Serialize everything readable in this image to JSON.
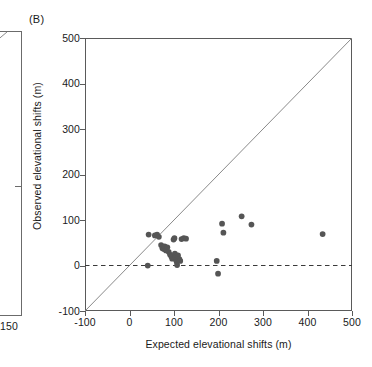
{
  "figure": {
    "panel_label": "(B)",
    "background_color": "#ffffff"
  },
  "left_partial_panel": {
    "visible_tick_label": "150",
    "axis_color": "#6b6b6b",
    "note_visible": "right edge of adjacent panel"
  },
  "chart_data": {
    "type": "scatter",
    "title": "(B)",
    "xlabel": "Expected elevational shifts (m)",
    "ylabel": "Observed elevational shifts (m)",
    "xlim": [
      -100,
      500
    ],
    "ylim": [
      -100,
      500
    ],
    "xticks": [
      -100,
      0,
      100,
      200,
      300,
      400,
      500
    ],
    "xtick_labels": [
      "-100",
      "0",
      "100",
      "200",
      "300",
      "400",
      "500"
    ],
    "yticks": [
      -100,
      0,
      100,
      200,
      300,
      400,
      500
    ],
    "ytick_labels": [
      "-100",
      "0",
      "100",
      "200",
      "300",
      "400",
      "500"
    ],
    "grid": false,
    "legend": null,
    "point_color": "#555555",
    "point_size": 4.6,
    "reference_lines": [
      {
        "name": "one-to-one-line",
        "style": "solid",
        "color": "#8a8a8a",
        "from": [
          -100,
          -100
        ],
        "to": [
          500,
          500
        ]
      },
      {
        "name": "zero-observed-shift-line",
        "style": "dashed",
        "color": "#3a3a3a",
        "y": 0
      }
    ],
    "points": [
      {
        "x": 43,
        "y": 68
      },
      {
        "x": 41,
        "y": 0
      },
      {
        "x": 57,
        "y": 66
      },
      {
        "x": 62,
        "y": 68
      },
      {
        "x": 66,
        "y": 63
      },
      {
        "x": 71,
        "y": 45
      },
      {
        "x": 74,
        "y": 38
      },
      {
        "x": 77,
        "y": 36
      },
      {
        "x": 79,
        "y": 42
      },
      {
        "x": 82,
        "y": 33
      },
      {
        "x": 85,
        "y": 40
      },
      {
        "x": 88,
        "y": 30
      },
      {
        "x": 91,
        "y": 24
      },
      {
        "x": 94,
        "y": 20
      },
      {
        "x": 96,
        "y": 15
      },
      {
        "x": 99,
        "y": 57
      },
      {
        "x": 101,
        "y": 60
      },
      {
        "x": 102,
        "y": 26
      },
      {
        "x": 103,
        "y": 18
      },
      {
        "x": 105,
        "y": 12
      },
      {
        "x": 106,
        "y": 8
      },
      {
        "x": 107,
        "y": 1
      },
      {
        "x": 109,
        "y": 22
      },
      {
        "x": 112,
        "y": 14
      },
      {
        "x": 114,
        "y": 10
      },
      {
        "x": 117,
        "y": 58
      },
      {
        "x": 122,
        "y": 60
      },
      {
        "x": 127,
        "y": 59
      },
      {
        "x": 196,
        "y": 10
      },
      {
        "x": 199,
        "y": -18
      },
      {
        "x": 208,
        "y": 92
      },
      {
        "x": 211,
        "y": 72
      },
      {
        "x": 252,
        "y": 108
      },
      {
        "x": 274,
        "y": 90
      },
      {
        "x": 434,
        "y": 69
      }
    ]
  }
}
